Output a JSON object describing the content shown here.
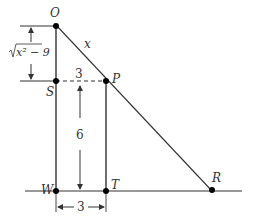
{
  "diagram": {
    "points": {
      "O": "O",
      "S": "S",
      "P": "P",
      "W": "W",
      "T": "T",
      "R": "R"
    },
    "labels": {
      "hypotenuse": "x",
      "top_segment": "3",
      "vertical_height": "6",
      "bottom_width": "3",
      "left_dimension_radical": "√",
      "left_dimension_expr": "x² − 9"
    },
    "colors": {
      "line": "#333333",
      "point": "#000000"
    }
  }
}
